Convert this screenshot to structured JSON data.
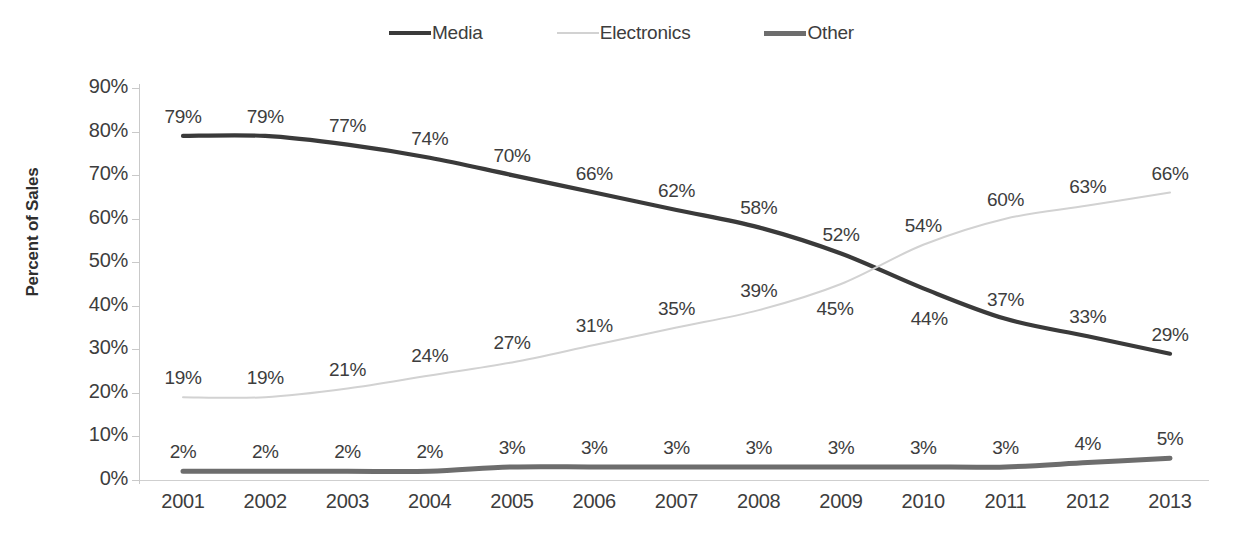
{
  "chart_data": {
    "type": "line",
    "title": "",
    "xlabel": "",
    "ylabel": "Percent of Sales",
    "ylim": [
      0,
      90
    ],
    "ytick_labels": [
      "90%",
      "80%",
      "70%",
      "60%",
      "50%",
      "40%",
      "30%",
      "20%",
      "10%",
      "0%"
    ],
    "ytick_values": [
      90,
      80,
      70,
      60,
      50,
      40,
      30,
      20,
      10,
      0
    ],
    "grid": false,
    "legend_position": "top-center",
    "categories": [
      "2001",
      "2002",
      "2003",
      "2004",
      "2005",
      "2006",
      "2007",
      "2008",
      "2009",
      "2010",
      "2011",
      "2012",
      "2013"
    ],
    "series": [
      {
        "name": "Media",
        "color": "#3a3a3a",
        "values": [
          79,
          79,
          77,
          74,
          70,
          66,
          62,
          58,
          52,
          44,
          37,
          33,
          29
        ],
        "labels": [
          "79%",
          "79%",
          "77%",
          "74%",
          "70%",
          "66%",
          "62%",
          "58%",
          "52%",
          "44%",
          "37%",
          "33%",
          "29%"
        ]
      },
      {
        "name": "Electronics",
        "color": "#d2d2d2",
        "values": [
          19,
          19,
          21,
          24,
          27,
          31,
          35,
          39,
          45,
          54,
          60,
          63,
          66
        ],
        "labels": [
          "19%",
          "19%",
          "21%",
          "24%",
          "27%",
          "31%",
          "35%",
          "39%",
          "45%",
          "54%",
          "60%",
          "63%",
          "66%"
        ]
      },
      {
        "name": "Other",
        "color": "#6d6d6d",
        "values": [
          2,
          2,
          2,
          2,
          3,
          3,
          3,
          3,
          3,
          3,
          3,
          4,
          5
        ],
        "labels": [
          "2%",
          "2%",
          "2%",
          "2%",
          "3%",
          "3%",
          "3%",
          "3%",
          "3%",
          "3%",
          "3%",
          "4%",
          "5%"
        ]
      }
    ]
  },
  "legend": {
    "items": [
      {
        "label": "Media",
        "swatch": "media-line-swatch"
      },
      {
        "label": "Electronics",
        "swatch": "electronics-line-swatch"
      },
      {
        "label": "Other",
        "swatch": "other-line-swatch"
      }
    ]
  },
  "axes": {
    "y_title": "Percent of Sales"
  }
}
